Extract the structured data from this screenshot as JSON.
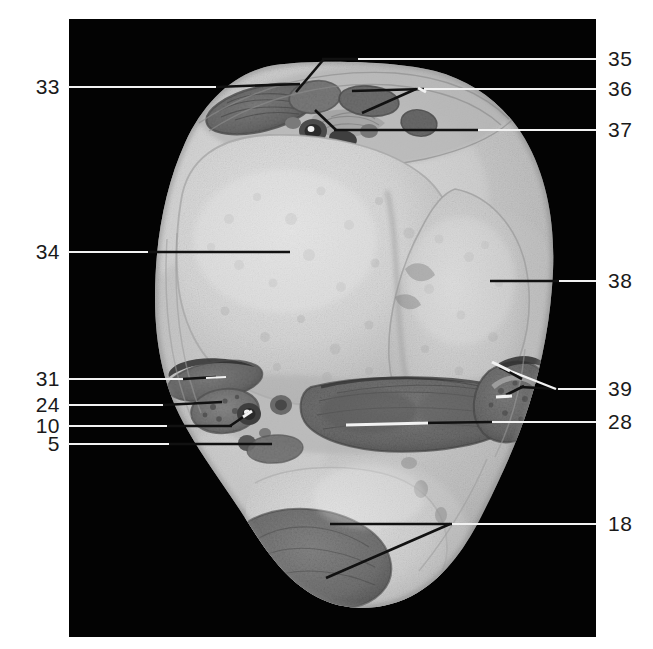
{
  "figure": {
    "kind": "anatomical-cross-section",
    "background_color": "#ffffff",
    "plate_color": "#030303",
    "label_color": "#1a1a1a",
    "leader_dark_color": "#111111",
    "leader_light_color": "#f2f2f2",
    "plate": {
      "x": 69,
      "y": 19,
      "width": 527,
      "height": 618
    }
  },
  "labels": {
    "left": [
      {
        "id": "33",
        "text": "33",
        "x": 38,
        "y": 76,
        "line_y": 87
      },
      {
        "id": "34",
        "text": "34",
        "x": 38,
        "y": 241,
        "line_y": 252
      },
      {
        "id": "31",
        "text": "31",
        "x": 38,
        "y": 368,
        "line_y": 379
      },
      {
        "id": "24",
        "text": "24",
        "x": 38,
        "y": 394,
        "line_y": 405
      },
      {
        "id": "10",
        "text": "10",
        "x": 38,
        "y": 415,
        "line_y": 426
      },
      {
        "id": "5",
        "text": "5",
        "x": 51,
        "y": 433,
        "line_y": 444
      }
    ],
    "right": [
      {
        "id": "35",
        "text": "35",
        "x": 608,
        "y": 48,
        "line_y": 59
      },
      {
        "id": "36",
        "text": "36",
        "x": 608,
        "y": 78,
        "line_y": 89
      },
      {
        "id": "37",
        "text": "37",
        "x": 608,
        "y": 119,
        "line_y": 130
      },
      {
        "id": "38",
        "text": "38",
        "x": 608,
        "y": 270,
        "line_y": 281
      },
      {
        "id": "39",
        "text": "39",
        "x": 608,
        "y": 378,
        "line_y": 389
      },
      {
        "id": "28",
        "text": "28",
        "x": 608,
        "y": 411,
        "line_y": 422
      },
      {
        "id": "18",
        "text": "18",
        "x": 608,
        "y": 513,
        "line_y": 524
      }
    ]
  },
  "leader_lines": {
    "note": "Coordinates are in full-figure pixel space; segments drawn dark over tissue and light over black plate.",
    "33": {
      "from": [
        68,
        87
      ],
      "to": [
        233,
        84
      ]
    },
    "34": {
      "from": [
        68,
        252
      ],
      "to": [
        290,
        252
      ]
    },
    "31": {
      "from": [
        68,
        379
      ],
      "to": [
        215,
        377
      ]
    },
    "24": {
      "from": [
        68,
        405
      ],
      "to": [
        218,
        403
      ]
    },
    "10": {
      "from": [
        68,
        426
      ],
      "to": [
        249,
        414
      ]
    },
    "5": {
      "from": [
        68,
        444
      ],
      "to": [
        272,
        444
      ]
    },
    "35": {
      "from": [
        596,
        59
      ],
      "to": [
        302,
        90
      ]
    },
    "36": {
      "from": [
        596,
        89
      ],
      "to": [
        349,
        92
      ]
    },
    "37": {
      "from": [
        596,
        130
      ],
      "to": [
        338,
        122
      ]
    },
    "38": {
      "from": [
        596,
        281
      ],
      "to": [
        496,
        281
      ]
    },
    "39": {
      "from": [
        596,
        389
      ],
      "to": [
        508,
        373
      ]
    },
    "28": {
      "from": [
        596,
        422
      ],
      "to": [
        338,
        425
      ]
    },
    "18": {
      "from": [
        596,
        524
      ],
      "to": [
        330,
        524
      ]
    }
  },
  "specimen": {
    "tissue_light": "#d2d2d2",
    "tissue_mid": "#bdbdbd",
    "tissue_shadow": "#a3a3a3",
    "muscle_dark": "#6e6e6e",
    "muscle_darker": "#585858",
    "vessel_dark": "#3c3c3c",
    "outline": "#8a8a8a"
  }
}
